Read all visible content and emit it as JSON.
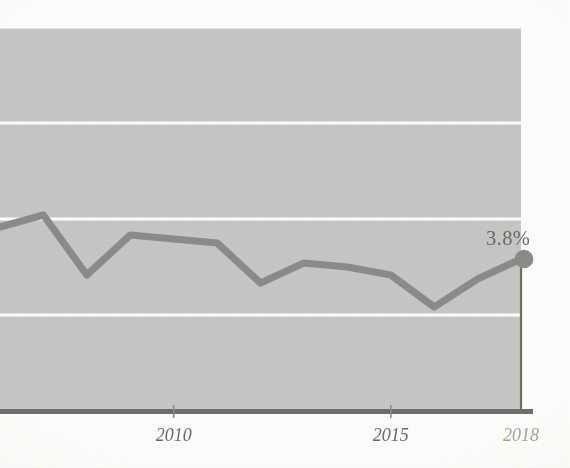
{
  "chart_data": {
    "type": "line",
    "title": "",
    "subtitle": "",
    "xlabel": "",
    "ylabel": "",
    "grid": true,
    "legend_position": "none",
    "x": [
      2006,
      2007,
      2008,
      2009,
      2010,
      2011,
      2012,
      2013,
      2014,
      2015,
      2016,
      2017,
      2018
    ],
    "series": [
      {
        "name": "rate",
        "values": [
          4.6,
          4.9,
          3.4,
          4.4,
          4.3,
          4.2,
          3.2,
          3.7,
          3.6,
          3.4,
          2.6,
          3.3,
          3.8
        ]
      }
    ],
    "x_tick_labels": [
      "2010",
      "2015",
      "2018"
    ],
    "x_tick_values": [
      2010,
      2015,
      2018
    ],
    "xlim": [
      2006,
      2018
    ],
    "ylim": [
      0,
      9.6
    ],
    "y_gridline_values": [
      2.4,
      4.8,
      7.2,
      9.6
    ],
    "end_point_label": "3.8%",
    "end_point_value": 3.8,
    "end_point_x": 2018,
    "colors": {
      "plot_background": "#c6c6c4",
      "gridline": "#fdfdfb",
      "series_line": "#8b8b89",
      "axis_line": "#6e6e6c",
      "end_marker": "#8b8b89",
      "tick_label": "#6a6a68",
      "tick_label_muted": "#a3a3a0",
      "value_label": "#6a6a68",
      "page_background": "#fdfdfb"
    }
  },
  "axis": {
    "ticks": [
      {
        "label": "2010",
        "x": 178,
        "muted": false
      },
      {
        "label": "2015",
        "x": 398,
        "muted": false
      },
      {
        "label": "2018",
        "x": 531,
        "muted": true
      }
    ]
  },
  "annotation": {
    "value_label": "3.8%"
  }
}
